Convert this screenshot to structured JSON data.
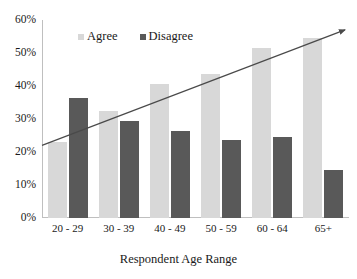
{
  "chart_data": {
    "type": "bar",
    "title": "",
    "subtitle": "",
    "xlabel": "Respondent Age Range",
    "ylabel": "",
    "categories": [
      "20 - 29",
      "30 - 39",
      "40 - 49",
      "50 - 59",
      "60 - 64",
      "65+"
    ],
    "series": [
      {
        "name": "Agree",
        "color": "#d8d8d8",
        "values": [
          23,
          32.5,
          40.5,
          43.5,
          51.5,
          54.5
        ]
      },
      {
        "name": "Disagree",
        "color": "#595959",
        "values": [
          36.5,
          29.5,
          26.5,
          23.5,
          24.5,
          14.5
        ]
      }
    ],
    "ylim": [
      0,
      60
    ],
    "ytick_labels": [
      "60%",
      "50%",
      "40%",
      "30%",
      "20%",
      "10%",
      "0%"
    ],
    "ytick_values": [
      60,
      50,
      40,
      30,
      20,
      10,
      0
    ],
    "grid": false,
    "legend_position": "top-left-inside",
    "annotations": [
      {
        "type": "trendline-arrow",
        "name": "agree-trendline",
        "color": "#4a4a4a",
        "start_value": 22,
        "end_value": 57
      }
    ]
  },
  "axis": {
    "y_ticks": [
      {
        "label": "60%",
        "value": 60
      },
      {
        "label": "50%",
        "value": 50
      },
      {
        "label": "40%",
        "value": 40
      },
      {
        "label": "30%",
        "value": 30
      },
      {
        "label": "20%",
        "value": 20
      },
      {
        "label": "10%",
        "value": 10
      },
      {
        "label": "0%",
        "value": 0
      }
    ]
  },
  "legend": {
    "items": [
      {
        "label": "Agree",
        "color": "#d8d8d8"
      },
      {
        "label": "Disagree",
        "color": "#595959"
      }
    ]
  }
}
